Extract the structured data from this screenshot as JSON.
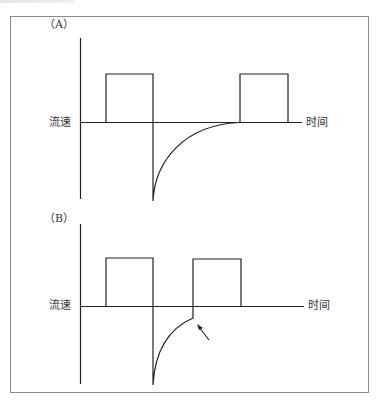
{
  "figure": {
    "frame": {
      "x": 10,
      "y": 16,
      "width": 359,
      "height": 377,
      "color": "#8a8a8a"
    },
    "stroke_color": "#222222",
    "panels": [
      {
        "id": "A",
        "label": "（A）",
        "y_axis_label": "流速",
        "x_axis_label": "时间",
        "description": "Two positive square flow pulses; after first pulse a sharp negative spike decays exponentially back to zero before the second pulse begins."
      },
      {
        "id": "B",
        "label": "（B）",
        "y_axis_label": "流速",
        "x_axis_label": "时间",
        "description": "Negative decay is interrupted before reaching zero; second pulse starts abruptly (arrow marks the interruption)."
      }
    ],
    "arrow": {
      "panel": "B",
      "points_to": "interrupted-decay"
    }
  }
}
